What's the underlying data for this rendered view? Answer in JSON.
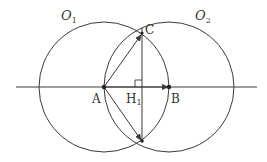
{
  "colors": {
    "stroke": "#3a3a3a",
    "label": "#333333",
    "background": "#ffffff"
  },
  "labels": {
    "O1": {
      "main": "O",
      "sub": "1"
    },
    "O2": {
      "main": "O",
      "sub": "2"
    },
    "C": "C",
    "A": "A",
    "H1": {
      "main": "H",
      "sub": "1"
    },
    "B": "B"
  },
  "geometry": {
    "line_y": 87,
    "line_x1": 16,
    "line_x2": 257,
    "A": [
      104,
      87
    ],
    "B": [
      169,
      87
    ],
    "C": [
      142,
      33
    ],
    "D": [
      142,
      141
    ],
    "H1": [
      142,
      87
    ],
    "circle_O1": {
      "cx": 104,
      "cy": 87,
      "r": 65
    },
    "circle_O2": {
      "cx": 169,
      "cy": 87,
      "r": 65
    }
  }
}
